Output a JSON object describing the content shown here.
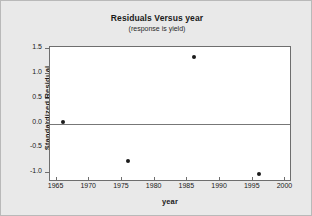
{
  "chart_data": {
    "type": "scatter",
    "title": "Residuals Versus year",
    "subtitle": "(response is yield)",
    "xlabel": "year",
    "ylabel": "Standardized Residual",
    "xlim": [
      1964,
      2001
    ],
    "ylim": [
      -1.18,
      1.55
    ],
    "xticks": [
      1965,
      1970,
      1975,
      1980,
      1985,
      1990,
      1995,
      2000
    ],
    "xtick_labels": [
      "1965",
      "1970",
      "1975",
      "1980",
      "1985",
      "1990",
      "1995",
      "2000"
    ],
    "yticks": [
      -1.0,
      -0.5,
      0.0,
      0.5,
      1.0,
      1.5
    ],
    "ytick_labels": [
      "-1.0",
      "-0.5",
      "0.0",
      "0.5",
      "1.0",
      "1.5"
    ],
    "grid": false,
    "legend": "none",
    "reference_line": 0.0,
    "points": [
      {
        "x": 1966,
        "y": 0.04
      },
      {
        "x": 1976,
        "y": -0.76
      },
      {
        "x": 1986,
        "y": 1.35
      },
      {
        "x": 1996,
        "y": -1.02
      }
    ],
    "marker_color": "#1b1b1b",
    "reference_line_color": "#777777",
    "plot_background": "#ffffff",
    "figure_background": "#e9e9e9",
    "axis_color": "#6e6e6e"
  }
}
